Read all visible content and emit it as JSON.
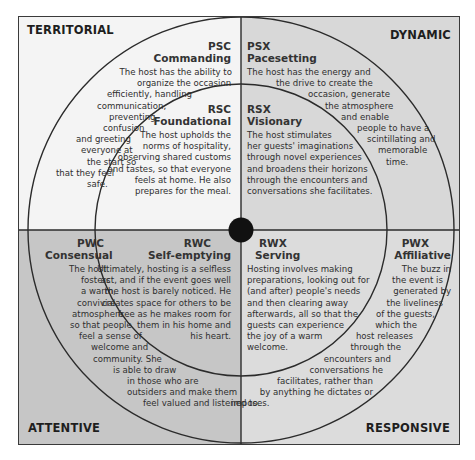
{
  "colors": {
    "territorial": "#f4f4f4",
    "dynamic": "#d8d8d8",
    "attentive": "#c6c6c6",
    "responsive": "#dcdcdc",
    "lines": "#2b2b2b",
    "hub": "#111111"
  },
  "corners": {
    "top_left": "TERRITORIAL",
    "top_right": "DYNAMIC",
    "bottom_left": "ATTENTIVE",
    "bottom_right": "RESPONSIVE"
  },
  "styles": {
    "psc": {
      "code": "PSC",
      "title": "Commanding",
      "lines": [
        "The host has the ability to",
        "organize the occasion",
        "efficiently, handling",
        "communication,",
        "preventing",
        "confusion",
        "and greeting",
        "everyone at",
        "the start so",
        "that they feel",
        "safe."
      ]
    },
    "rsc": {
      "code": "RSC",
      "title": "Foundational",
      "lines": [
        "The host upholds the",
        "norms of hospitality,",
        "observing shared customs",
        "and tastes, so that everyone",
        "feels at home. He also",
        "prepares for the meal."
      ]
    },
    "psx": {
      "code": "PSX",
      "title": "Pacesetting",
      "lines": [
        "The host has the energy and",
        "the drive to create the",
        "occasion, generate",
        "the atmosphere",
        "and enable",
        "people to have a",
        "scintillating and",
        "memorable",
        "time."
      ]
    },
    "rsx": {
      "code": "RSX",
      "title": "Visionary",
      "lines": [
        "The host stimulates",
        "her guests' imaginations",
        "through novel experiences",
        "and broadens their horizons",
        "through the encounters and",
        "conversations she facilitates."
      ]
    },
    "pwc": {
      "code": "PWC",
      "title": "Consensual",
      "lines": [
        "The host",
        "fosters",
        "a warm,",
        "convivial",
        "atmosphere",
        "so that people",
        "feel a sense of",
        "welcome and",
        "community. She",
        "is able to draw",
        "in those who are",
        "outsiders and make them",
        "feel valued and listened to."
      ]
    },
    "rwc": {
      "code": "RWC",
      "title": "Self-emptying",
      "lines": [
        "Ultimately, hosting is a selfless",
        "act, and if the event goes well",
        "the host is barely noticed. He",
        "creates space for others to be",
        "free as he makes room for",
        "them in his home and",
        "his heart."
      ]
    },
    "rwx": {
      "code": "RWX",
      "title": "Serving",
      "lines": [
        "Hosting involves making",
        "preparations, looking out for",
        "(and after) people's needs",
        "and then clearing away",
        "afterwards, all so that the",
        "guests can experience",
        "the joy of a warm",
        "welcome."
      ]
    },
    "pwx": {
      "code": "PWX",
      "title": "Affiliative",
      "lines": [
        "The buzz in",
        "the event is",
        "generated by",
        "the liveliness",
        "of the guests,",
        "which the",
        "host releases",
        "through the",
        "encounters and",
        "conversations he",
        "facilitates, rather than",
        "by anything he dictates or",
        "imposes."
      ]
    }
  }
}
